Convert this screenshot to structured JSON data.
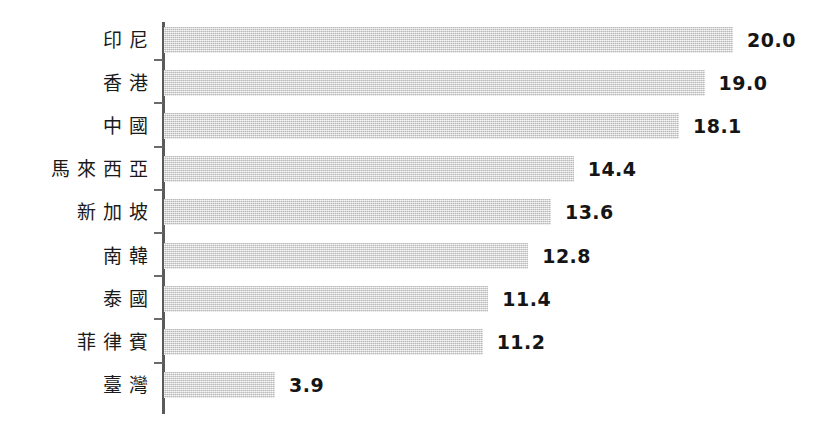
{
  "chart_data": {
    "type": "bar",
    "orientation": "horizontal",
    "title": "",
    "subtitle": "",
    "xlabel": "",
    "ylabel": "",
    "grid": false,
    "legend": null,
    "axis": {
      "value_axis_min": 0,
      "value_axis_max": 20.0,
      "value_axis_ticks_shown": false,
      "category_axis_visible": true,
      "category_tick_marks": true
    },
    "categories": [
      "印尼",
      "香港",
      "中國",
      "馬來西亞",
      "新加坡",
      "南韓",
      "泰國",
      "菲律賓",
      "臺灣"
    ],
    "values": [
      20.0,
      19.0,
      18.1,
      14.4,
      13.6,
      12.8,
      11.4,
      11.2,
      3.9
    ],
    "value_labels": [
      "20.0",
      "19.0",
      "18.1",
      "14.4",
      "13.6",
      "12.8",
      "11.4",
      "11.2",
      "3.9"
    ],
    "bars": [
      {
        "category": "印尼",
        "value": 20.0,
        "label": "20.0"
      },
      {
        "category": "香港",
        "value": 19.0,
        "label": "19.0"
      },
      {
        "category": "中國",
        "value": 18.1,
        "label": "18.1"
      },
      {
        "category": "馬來西亞",
        "value": 14.4,
        "label": "14.4"
      },
      {
        "category": "新加坡",
        "value": 13.6,
        "label": "13.6"
      },
      {
        "category": "南韓",
        "value": 12.8,
        "label": "12.8"
      },
      {
        "category": "泰國",
        "value": 11.4,
        "label": "11.4"
      },
      {
        "category": "菲律賓",
        "value": 11.2,
        "label": "11.2"
      },
      {
        "category": "臺灣",
        "value": 3.9,
        "label": "3.9"
      }
    ],
    "colors": {
      "bar_fill": "#d9d9d9",
      "axis_line": "#5a5a5a",
      "label_text": "#1a1a1a",
      "value_text": "#151515",
      "background": "#ffffff"
    }
  }
}
